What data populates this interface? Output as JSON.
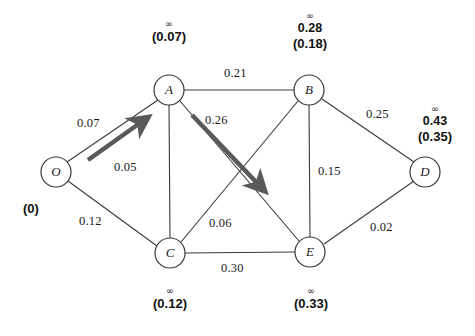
{
  "diagram": {
    "colors": {
      "edge": "#3a3a3a",
      "node_stroke": "#3a3a3a",
      "node_fill": "#ffffff",
      "highlight_arrow": "#595959",
      "text": "#111111",
      "background": "#ffffff"
    }
  },
  "nodes": [
    {
      "id": "O",
      "label": "O",
      "cx": 56,
      "cy": 172,
      "r": 15
    },
    {
      "id": "A",
      "label": "A",
      "cx": 169,
      "cy": 90,
      "r": 15
    },
    {
      "id": "B",
      "label": "B",
      "cx": 309,
      "cy": 90,
      "r": 15
    },
    {
      "id": "C",
      "label": "C",
      "cx": 170,
      "cy": 253,
      "r": 15
    },
    {
      "id": "D",
      "label": "D",
      "cx": 425,
      "cy": 172,
      "r": 15
    },
    {
      "id": "E",
      "label": "E",
      "cx": 310,
      "cy": 252,
      "r": 15
    }
  ],
  "edges": [
    {
      "id": "O-A",
      "from": "O",
      "to": "A",
      "weight": "0.07",
      "highlight": true
    },
    {
      "id": "O-C",
      "from": "O",
      "to": "C",
      "weight": "0.12",
      "highlight": false
    },
    {
      "id": "A-B",
      "from": "A",
      "to": "B",
      "weight": "0.21",
      "highlight": false
    },
    {
      "id": "A-C",
      "from": "A",
      "to": "C",
      "weight": "0.05",
      "highlight": false
    },
    {
      "id": "A-E",
      "from": "A",
      "to": "E",
      "weight": "0.26",
      "highlight": true
    },
    {
      "id": "B-C",
      "from": "B",
      "to": "C",
      "weight": "0.06",
      "highlight": false
    },
    {
      "id": "B-E",
      "from": "B",
      "to": "E",
      "weight": "0.15",
      "highlight": false
    },
    {
      "id": "B-D",
      "from": "B",
      "to": "D",
      "weight": "0.25",
      "highlight": false
    },
    {
      "id": "C-E",
      "from": "C",
      "to": "E",
      "weight": "0.30",
      "highlight": false
    },
    {
      "id": "D-E",
      "from": "D",
      "to": "E",
      "weight": "0.02",
      "highlight": false
    }
  ],
  "edge_labels": {
    "O-A": "0.07",
    "O-C": "0.12",
    "A-B": "0.21",
    "A-C": "0.05",
    "A-E": "0.26",
    "B-C": "0.06",
    "B-E": "0.15",
    "B-D": "0.25",
    "C-E": "0.30",
    "D-E": "0.02"
  },
  "distance_labels": {
    "O": {
      "node": "O",
      "infinity": "",
      "temporary": "",
      "permanent": "(0)"
    },
    "A": {
      "node": "A",
      "infinity": "∞",
      "temporary": "",
      "permanent": "(0.07)"
    },
    "B": {
      "node": "B",
      "infinity": "∞",
      "temporary": "0.28",
      "permanent": "(0.18)"
    },
    "C": {
      "node": "C",
      "infinity": "∞",
      "temporary": "",
      "permanent": "(0.12)"
    },
    "D": {
      "node": "D",
      "infinity": "∞",
      "temporary": "0.43",
      "permanent": "(0.35)"
    },
    "E": {
      "node": "E",
      "infinity": "∞",
      "temporary": "",
      "permanent": "(0.33)"
    }
  }
}
